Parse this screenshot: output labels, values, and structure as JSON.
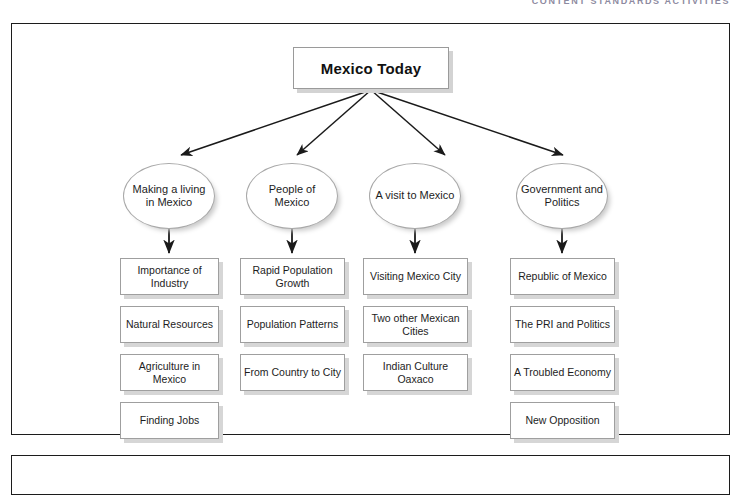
{
  "page": {
    "running_head": "CONTENT STANDARDS ACTIVITIES",
    "ghost_watermark": "UNIT 3 ACTIVITIES"
  },
  "diagram": {
    "type": "hierarchy-tree",
    "title": "Mexico Today",
    "branches": [
      {
        "label": "Making a living in Mexico",
        "items": [
          "Importance of Industry",
          "Natural Resources",
          "Agriculture in Mexico",
          "Finding Jobs"
        ]
      },
      {
        "label": "People of Mexico",
        "items": [
          "Rapid Population Growth",
          "Population Patterns",
          "From Country to City"
        ]
      },
      {
        "label": "A visit to Mexico",
        "items": [
          "Visiting Mexico City",
          "Two other Mexican Cities",
          "Indian Culture Oaxaco"
        ]
      },
      {
        "label": "Government and Politics",
        "items": [
          "Republic of Mexico",
          "The PRI and Politics",
          "A Troubled Economy",
          "New Opposition"
        ]
      }
    ]
  },
  "colors": {
    "panel_border": "#1c1c1c",
    "node_border": "#9f9f9f",
    "shadow": "#d6d6d6",
    "arrow": "#1a1a1a",
    "running_head": "#8d8aa0"
  }
}
